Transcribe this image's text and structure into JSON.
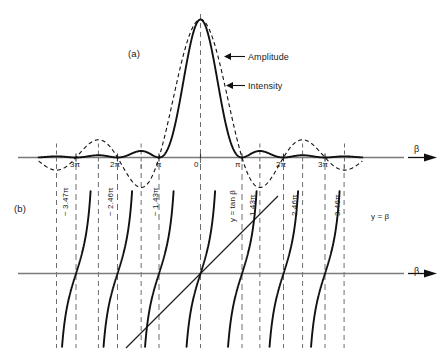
{
  "figure": {
    "panels": [
      {
        "id": "a",
        "label": "(a)",
        "axis_label": "β",
        "axis_arrow": "→",
        "annotations": [
          {
            "name": "amplitude",
            "text": "Amplitude"
          },
          {
            "name": "intensity",
            "text": "Intensity"
          }
        ],
        "tick_labels_left": [
          "3π",
          "2π",
          "π"
        ],
        "tick_label_center": "0",
        "tick_labels_right": [
          "π",
          "2π",
          "3π"
        ]
      },
      {
        "id": "b",
        "label": "(b)",
        "axis_label": "β",
        "axis_arrow": "→",
        "curve_labels": [
          {
            "name": "tangent-curve",
            "text": "y = tan β"
          },
          {
            "name": "line-y-equals-beta",
            "text": "y = β"
          }
        ],
        "root_labels_negative": [
          "− 3.47π",
          "− 2.46π",
          "− 1.43π"
        ],
        "root_labels_positive": [
          "1.43π",
          "2.46π",
          "3.46π"
        ]
      }
    ]
  },
  "chart_data": [
    {
      "type": "line",
      "name": "single-slit-diffraction",
      "title": "(a)",
      "xlabel": "β",
      "ylabel": "",
      "xlim": [
        -3.9,
        3.9
      ],
      "xunit": "π",
      "ylim": [
        -0.24,
        1.0
      ],
      "grid": false,
      "legend": [
        "Amplitude",
        "Intensity"
      ],
      "xticks": [
        -3,
        -2,
        -1,
        0,
        1,
        2,
        3
      ],
      "xticklabels": [
        "3π",
        "2π",
        "π",
        "0",
        "π",
        "2π",
        "3π"
      ],
      "series": [
        {
          "name": "Amplitude",
          "style": "dashed",
          "formula": "sin(β)/β",
          "zeros_at_pi_multiples": [
            -3,
            -2,
            -1,
            1,
            2,
            3
          ],
          "extrema": [
            {
              "x": 0,
              "y": 1.0
            },
            {
              "x": -1.43,
              "y": -0.217
            },
            {
              "x": 1.43,
              "y": -0.217
            },
            {
              "x": -2.46,
              "y": 0.128
            },
            {
              "x": 2.46,
              "y": 0.128
            },
            {
              "x": -3.47,
              "y": -0.091
            },
            {
              "x": 3.47,
              "y": -0.091
            }
          ]
        },
        {
          "name": "Intensity",
          "style": "solid",
          "formula": "(sin(β)/β)^2",
          "zeros_at_pi_multiples": [
            -3,
            -2,
            -1,
            1,
            2,
            3
          ],
          "extrema": [
            {
              "x": 0,
              "y": 1.0
            },
            {
              "x": -1.43,
              "y": 0.047
            },
            {
              "x": 1.43,
              "y": 0.047
            },
            {
              "x": -2.46,
              "y": 0.0165
            },
            {
              "x": 2.46,
              "y": 0.0165
            },
            {
              "x": -3.47,
              "y": 0.0083
            },
            {
              "x": 3.47,
              "y": 0.0083
            }
          ]
        }
      ]
    },
    {
      "type": "line",
      "name": "tan-beta-graphical-solution",
      "title": "(b)",
      "xlabel": "β",
      "ylabel": "y",
      "xlim": [
        -3.9,
        3.9
      ],
      "xunit": "π",
      "ylim": [
        -3.9,
        3.9
      ],
      "grid": false,
      "series": [
        {
          "name": "y = tan β",
          "style": "solid",
          "asymptotes_at_pi_multiples": [
            -3.5,
            -2.5,
            -1.5,
            -0.5,
            0.5,
            1.5,
            2.5,
            3.5
          ],
          "zeros_at_pi_multiples": [
            -3,
            -2,
            -1,
            0,
            1,
            2,
            3
          ]
        },
        {
          "name": "y = β",
          "style": "solid",
          "slope": 1,
          "intercept": 0
        }
      ],
      "intersections": [
        {
          "x": -3.47,
          "label": "− 3.47π"
        },
        {
          "x": -2.46,
          "label": "− 2.46π"
        },
        {
          "x": -1.43,
          "label": "− 1.43π"
        },
        {
          "x": 0,
          "label": "0"
        },
        {
          "x": 1.43,
          "label": "1.43π"
        },
        {
          "x": 2.46,
          "label": "2.46π"
        },
        {
          "x": 3.46,
          "label": "3.46π"
        }
      ],
      "vertical_dashed_pi_multiples": [
        -3.47,
        -3,
        -2.46,
        -2,
        -1.43,
        -1,
        0,
        1,
        1.43,
        2,
        2.46,
        3,
        3.46
      ]
    }
  ],
  "colors": {
    "curve": "#111111",
    "axis": "#7a7a7a",
    "dashed_guide": "#6e6e6e",
    "text": "#1a1a1a"
  }
}
